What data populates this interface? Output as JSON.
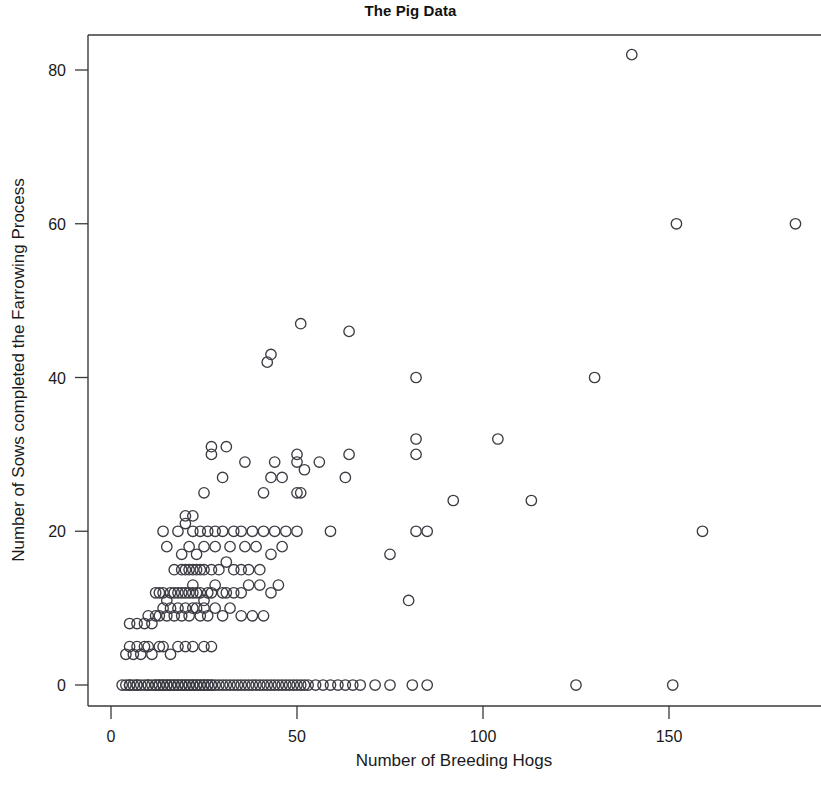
{
  "chart_data": {
    "type": "scatter",
    "title": "The Pig Data",
    "xlabel": "Number of Breeding Hogs",
    "ylabel": "Number of Sows completed the Farrowing Process",
    "xlim": [
      -4,
      190
    ],
    "ylim": [
      -3,
      87
    ],
    "xticks": [
      0,
      50,
      100,
      150
    ],
    "xtick_labels": [
      "0",
      "50",
      "100",
      "150"
    ],
    "yticks": [
      0,
      20,
      40,
      60,
      80
    ],
    "ytick_labels": [
      "0",
      "20",
      "40",
      "60",
      "80"
    ],
    "grid": false,
    "legend": null,
    "marker": "open-circle",
    "marker_color": "#3c3c44",
    "points": [
      [
        3,
        0
      ],
      [
        4,
        0
      ],
      [
        5,
        0
      ],
      [
        5,
        0
      ],
      [
        6,
        0
      ],
      [
        7,
        0
      ],
      [
        7,
        0
      ],
      [
        8,
        0
      ],
      [
        9,
        0
      ],
      [
        10,
        0
      ],
      [
        10,
        0
      ],
      [
        11,
        0
      ],
      [
        12,
        0
      ],
      [
        12,
        0
      ],
      [
        13,
        0
      ],
      [
        13,
        0
      ],
      [
        14,
        0
      ],
      [
        14,
        0
      ],
      [
        15,
        0
      ],
      [
        15,
        0
      ],
      [
        16,
        0
      ],
      [
        16,
        0
      ],
      [
        17,
        0
      ],
      [
        17,
        0
      ],
      [
        18,
        0
      ],
      [
        18,
        0
      ],
      [
        19,
        0
      ],
      [
        19,
        0
      ],
      [
        20,
        0
      ],
      [
        20,
        0
      ],
      [
        21,
        0
      ],
      [
        21,
        0
      ],
      [
        22,
        0
      ],
      [
        22,
        0
      ],
      [
        23,
        0
      ],
      [
        23,
        0
      ],
      [
        24,
        0
      ],
      [
        24,
        0
      ],
      [
        25,
        0
      ],
      [
        25,
        0
      ],
      [
        26,
        0
      ],
      [
        26,
        0
      ],
      [
        27,
        0
      ],
      [
        27,
        0
      ],
      [
        28,
        0
      ],
      [
        29,
        0
      ],
      [
        30,
        0
      ],
      [
        31,
        0
      ],
      [
        32,
        0
      ],
      [
        33,
        0
      ],
      [
        34,
        0
      ],
      [
        35,
        0
      ],
      [
        36,
        0
      ],
      [
        37,
        0
      ],
      [
        38,
        0
      ],
      [
        39,
        0
      ],
      [
        40,
        0
      ],
      [
        41,
        0
      ],
      [
        42,
        0
      ],
      [
        43,
        0
      ],
      [
        44,
        0
      ],
      [
        45,
        0
      ],
      [
        46,
        0
      ],
      [
        47,
        0
      ],
      [
        48,
        0
      ],
      [
        49,
        0
      ],
      [
        50,
        0
      ],
      [
        51,
        0
      ],
      [
        52,
        0
      ],
      [
        53,
        0
      ],
      [
        55,
        0
      ],
      [
        57,
        0
      ],
      [
        59,
        0
      ],
      [
        61,
        0
      ],
      [
        63,
        0
      ],
      [
        65,
        0
      ],
      [
        67,
        0
      ],
      [
        71,
        0
      ],
      [
        75,
        0
      ],
      [
        81,
        0
      ],
      [
        85,
        0
      ],
      [
        125,
        0
      ],
      [
        151,
        0
      ],
      [
        4,
        4
      ],
      [
        5,
        5
      ],
      [
        6,
        4
      ],
      [
        7,
        5
      ],
      [
        8,
        4
      ],
      [
        9,
        5
      ],
      [
        10,
        5
      ],
      [
        11,
        4
      ],
      [
        13,
        5
      ],
      [
        14,
        5
      ],
      [
        16,
        4
      ],
      [
        18,
        5
      ],
      [
        20,
        5
      ],
      [
        22,
        5
      ],
      [
        25,
        5
      ],
      [
        27,
        5
      ],
      [
        5,
        8
      ],
      [
        7,
        8
      ],
      [
        9,
        8
      ],
      [
        10,
        9
      ],
      [
        11,
        8
      ],
      [
        12,
        9
      ],
      [
        13,
        9
      ],
      [
        14,
        10
      ],
      [
        15,
        9
      ],
      [
        16,
        10
      ],
      [
        17,
        9
      ],
      [
        18,
        10
      ],
      [
        19,
        9
      ],
      [
        20,
        10
      ],
      [
        21,
        9
      ],
      [
        22,
        10
      ],
      [
        23,
        10
      ],
      [
        24,
        9
      ],
      [
        25,
        10
      ],
      [
        26,
        9
      ],
      [
        28,
        10
      ],
      [
        30,
        9
      ],
      [
        32,
        10
      ],
      [
        35,
        9
      ],
      [
        38,
        9
      ],
      [
        41,
        9
      ],
      [
        12,
        12
      ],
      [
        13,
        12
      ],
      [
        14,
        12
      ],
      [
        15,
        11
      ],
      [
        16,
        12
      ],
      [
        17,
        12
      ],
      [
        18,
        12
      ],
      [
        19,
        12
      ],
      [
        20,
        12
      ],
      [
        21,
        12
      ],
      [
        22,
        12
      ],
      [
        22,
        13
      ],
      [
        23,
        12
      ],
      [
        24,
        12
      ],
      [
        25,
        11
      ],
      [
        26,
        12
      ],
      [
        27,
        12
      ],
      [
        28,
        13
      ],
      [
        30,
        12
      ],
      [
        31,
        12
      ],
      [
        33,
        12
      ],
      [
        35,
        12
      ],
      [
        37,
        13
      ],
      [
        40,
        13
      ],
      [
        43,
        12
      ],
      [
        45,
        13
      ],
      [
        17,
        15
      ],
      [
        19,
        15
      ],
      [
        20,
        15
      ],
      [
        21,
        15
      ],
      [
        22,
        15
      ],
      [
        23,
        15
      ],
      [
        24,
        15
      ],
      [
        25,
        15
      ],
      [
        27,
        15
      ],
      [
        29,
        15
      ],
      [
        31,
        16
      ],
      [
        33,
        15
      ],
      [
        35,
        15
      ],
      [
        37,
        15
      ],
      [
        40,
        15
      ],
      [
        15,
        18
      ],
      [
        19,
        17
      ],
      [
        21,
        18
      ],
      [
        23,
        17
      ],
      [
        25,
        18
      ],
      [
        28,
        18
      ],
      [
        32,
        18
      ],
      [
        36,
        18
      ],
      [
        39,
        18
      ],
      [
        43,
        17
      ],
      [
        46,
        18
      ],
      [
        75,
        17
      ],
      [
        14,
        20
      ],
      [
        18,
        20
      ],
      [
        20,
        21
      ],
      [
        20,
        22
      ],
      [
        22,
        20
      ],
      [
        22,
        22
      ],
      [
        24,
        20
      ],
      [
        26,
        20
      ],
      [
        28,
        20
      ],
      [
        30,
        20
      ],
      [
        33,
        20
      ],
      [
        35,
        20
      ],
      [
        38,
        20
      ],
      [
        41,
        20
      ],
      [
        44,
        20
      ],
      [
        47,
        20
      ],
      [
        50,
        20
      ],
      [
        59,
        20
      ],
      [
        82,
        20
      ],
      [
        85,
        20
      ],
      [
        159,
        20
      ],
      [
        25,
        25
      ],
      [
        41,
        25
      ],
      [
        50,
        25
      ],
      [
        51,
        25
      ],
      [
        30,
        27
      ],
      [
        43,
        27
      ],
      [
        46,
        27
      ],
      [
        63,
        27
      ],
      [
        27,
        30
      ],
      [
        27,
        31
      ],
      [
        31,
        31
      ],
      [
        36,
        29
      ],
      [
        44,
        29
      ],
      [
        50,
        29
      ],
      [
        50,
        30
      ],
      [
        52,
        28
      ],
      [
        56,
        29
      ],
      [
        64,
        30
      ],
      [
        82,
        30
      ],
      [
        82,
        32
      ],
      [
        104,
        32
      ],
      [
        80,
        11
      ],
      [
        92,
        24
      ],
      [
        113,
        24
      ],
      [
        82,
        40
      ],
      [
        130,
        40
      ],
      [
        42,
        42
      ],
      [
        43,
        43
      ],
      [
        51,
        47
      ],
      [
        64,
        46
      ],
      [
        152,
        60
      ],
      [
        184,
        60
      ],
      [
        140,
        82
      ]
    ]
  },
  "meta": {
    "background_color": "#ffffff",
    "frame_color": "#3a3a3a",
    "text_color": "#1a1a1a"
  }
}
